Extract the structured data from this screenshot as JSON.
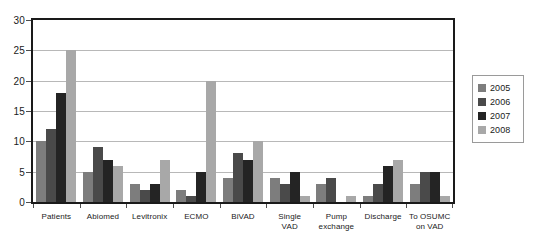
{
  "chart_data": {
    "type": "bar",
    "title": "",
    "xlabel": "",
    "ylabel": "",
    "ylim": [
      0,
      30
    ],
    "ytick_values": [
      30,
      25,
      20,
      15,
      10,
      5,
      0
    ],
    "grid": true,
    "legend_position": "right",
    "categories": [
      "Patients",
      "Abiomed",
      "Levitronix",
      "ECMO",
      "BiVAD",
      "Single\nVAD",
      "Pump\nexchange",
      "Discharge",
      "To OSUMC\non VAD"
    ],
    "series": [
      {
        "name": "2005",
        "color": "#7d7d7d",
        "values": [
          10,
          5,
          3,
          2,
          4,
          4,
          3,
          1,
          3
        ]
      },
      {
        "name": "2006",
        "color": "#4a4a4a",
        "values": [
          12,
          9,
          2,
          1,
          8,
          3,
          4,
          3,
          5
        ]
      },
      {
        "name": "2007",
        "color": "#242424",
        "values": [
          18,
          7,
          3,
          5,
          7,
          5,
          0,
          6,
          5
        ]
      },
      {
        "name": "2008",
        "color": "#a8a8a8",
        "values": [
          25,
          6,
          7,
          20,
          10,
          1,
          1,
          7,
          1
        ]
      }
    ]
  },
  "legend": {
    "items": [
      {
        "label": "2005",
        "color": "#7d7d7d"
      },
      {
        "label": "2006",
        "color": "#4a4a4a"
      },
      {
        "label": "2007",
        "color": "#242424"
      },
      {
        "label": "2008",
        "color": "#a8a8a8"
      }
    ]
  }
}
